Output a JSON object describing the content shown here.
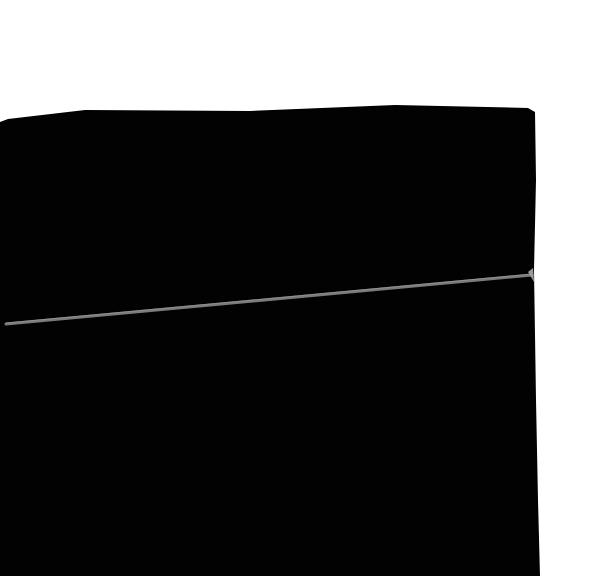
{
  "scene": {
    "description": "Black box-like object photographed on white background with a thin grey diagonal seam",
    "colors": {
      "background": "#ffffff",
      "object": "#020202",
      "seam": "#7a7a7a"
    }
  }
}
